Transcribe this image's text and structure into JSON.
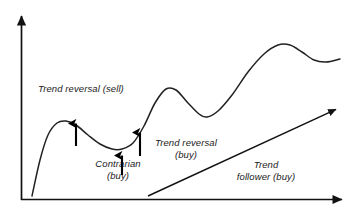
{
  "figure": {
    "background_color": "#ffffff",
    "line_color": "#1a1a1a",
    "arrow_color": "#000000"
  },
  "axes": {
    "y_axis_name": "vertical-axis",
    "x_axis_name": "horizontal-axis",
    "y_axis_label": "",
    "x_axis_label": "",
    "tick_labels": []
  },
  "labels": {
    "trend_reversal_sell": "Trend reversal (sell)",
    "contrarian": "Contrarian",
    "contrarian_buy": "(buy)",
    "trend_reversal": "Trend reversal",
    "trend_reversal_buy": "(buy)",
    "trend": "Trend",
    "trend_follower_buy": "follower (buy)"
  },
  "markers": {
    "signal_arrows": [
      {
        "name": "signal-arrow-trend-reversal-sell",
        "x": 76,
        "y_base": 146,
        "y_tip": 120
      },
      {
        "name": "signal-arrow-contrarian-buy",
        "x": 122,
        "y_base": 175,
        "y_tip": 152
      },
      {
        "name": "signal-arrow-trend-reversal-buy",
        "x": 140,
        "y_base": 156,
        "y_tip": 129
      }
    ]
  },
  "chart_data": {
    "type": "line",
    "title": "",
    "xlabel": "",
    "ylabel": "",
    "grid": false,
    "legend": null,
    "xlim": [
      0,
      362
    ],
    "ylim": [
      217,
      0
    ],
    "series": [
      {
        "name": "price-curve",
        "points": [
          [
            32,
            196
          ],
          [
            40,
            160
          ],
          [
            48,
            135
          ],
          [
            57,
            123
          ],
          [
            66,
            121
          ],
          [
            76,
            125
          ],
          [
            88,
            135
          ],
          [
            100,
            144
          ],
          [
            112,
            149
          ],
          [
            122,
            149
          ],
          [
            133,
            143
          ],
          [
            144,
            126
          ],
          [
            155,
            103
          ],
          [
            166,
            89
          ],
          [
            176,
            90
          ],
          [
            188,
            103
          ],
          [
            199,
            114
          ],
          [
            207,
            117
          ],
          [
            218,
            111
          ],
          [
            232,
            95
          ],
          [
            248,
            72
          ],
          [
            264,
            54
          ],
          [
            278,
            45
          ],
          [
            290,
            45
          ],
          [
            302,
            52
          ],
          [
            314,
            60
          ],
          [
            326,
            62
          ],
          [
            340,
            59
          ]
        ]
      },
      {
        "name": "trend-follower-line",
        "points": [
          [
            148,
            196
          ],
          [
            341,
            107
          ]
        ]
      }
    ],
    "annotations": [
      {
        "text": "Trend reversal (sell)",
        "x": 38,
        "y": 92
      },
      {
        "text": "Contrarian (buy)",
        "x": 118,
        "y": 170
      },
      {
        "text": "Trend reversal (buy)",
        "x": 186,
        "y": 149
      },
      {
        "text": "Trend follower (buy)",
        "x": 266,
        "y": 171
      }
    ]
  }
}
